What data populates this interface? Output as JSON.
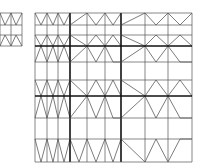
{
  "diagram": {
    "colors": {
      "background": "#ffffff",
      "thin_line": "#555555",
      "thick_line": "#111111"
    },
    "small_grid": {
      "x": [
        0,
        11,
        22
      ],
      "y": [
        13,
        25,
        35,
        46
      ],
      "zigzags": [
        [
          [
            0,
            13
          ],
          [
            5,
            25
          ],
          [
            11,
            13
          ],
          [
            16,
            25
          ],
          [
            22,
            13
          ]
        ],
        [
          [
            0,
            46
          ],
          [
            5,
            35
          ],
          [
            11,
            46
          ],
          [
            16,
            35
          ],
          [
            22,
            46
          ]
        ]
      ]
    },
    "large_grid": {
      "x": [
        35,
        47,
        58,
        70,
        87,
        105,
        121,
        145,
        168,
        192
      ],
      "y": [
        13,
        25,
        35,
        46,
        62,
        80,
        96,
        118,
        139,
        162
      ],
      "thick_x": [
        70,
        121
      ],
      "thick_y": [
        46,
        96
      ],
      "zigzags": [
        [
          [
            35,
            13
          ],
          [
            41,
            25
          ],
          [
            47,
            13
          ],
          [
            53,
            25
          ],
          [
            58,
            13
          ],
          [
            64,
            25
          ],
          [
            70,
            13
          ]
        ],
        [
          [
            70,
            25
          ],
          [
            87,
            13
          ],
          [
            96,
            25
          ],
          [
            105,
            13
          ],
          [
            113,
            25
          ],
          [
            121,
            13
          ]
        ],
        [
          [
            121,
            25
          ],
          [
            145,
            13
          ],
          [
            156,
            25
          ],
          [
            168,
            13
          ],
          [
            180,
            25
          ],
          [
            192,
            13
          ]
        ],
        [
          [
            35,
            35
          ],
          [
            41,
            46
          ],
          [
            47,
            35
          ],
          [
            53,
            46
          ],
          [
            58,
            35
          ],
          [
            64,
            46
          ],
          [
            70,
            35
          ]
        ],
        [
          [
            35,
            62
          ],
          [
            41,
            46
          ],
          [
            47,
            62
          ],
          [
            53,
            46
          ],
          [
            58,
            62
          ],
          [
            64,
            46
          ],
          [
            70,
            62
          ]
        ],
        [
          [
            70,
            35
          ],
          [
            87,
            46
          ],
          [
            96,
            35
          ],
          [
            105,
            46
          ],
          [
            113,
            35
          ],
          [
            121,
            46
          ]
        ],
        [
          [
            70,
            62
          ],
          [
            87,
            46
          ],
          [
            96,
            62
          ],
          [
            105,
            46
          ],
          [
            113,
            62
          ],
          [
            121,
            62
          ]
        ],
        [
          [
            121,
            35
          ],
          [
            145,
            46
          ],
          [
            156,
            35
          ],
          [
            168,
            46
          ],
          [
            180,
            35
          ],
          [
            192,
            46
          ]
        ],
        [
          [
            121,
            62
          ],
          [
            145,
            46
          ],
          [
            156,
            62
          ],
          [
            168,
            46
          ],
          [
            180,
            62
          ],
          [
            192,
            62
          ]
        ],
        [
          [
            35,
            80
          ],
          [
            41,
            96
          ],
          [
            47,
            80
          ],
          [
            53,
            96
          ],
          [
            58,
            80
          ],
          [
            64,
            96
          ],
          [
            70,
            80
          ]
        ],
        [
          [
            35,
            118
          ],
          [
            41,
            96
          ],
          [
            47,
            118
          ],
          [
            53,
            96
          ],
          [
            58,
            118
          ],
          [
            64,
            96
          ],
          [
            70,
            118
          ]
        ],
        [
          [
            70,
            80
          ],
          [
            87,
            96
          ],
          [
            96,
            80
          ],
          [
            105,
            96
          ],
          [
            113,
            80
          ],
          [
            121,
            96
          ]
        ],
        [
          [
            70,
            118
          ],
          [
            87,
            96
          ],
          [
            96,
            118
          ],
          [
            105,
            96
          ],
          [
            113,
            118
          ],
          [
            121,
            118
          ]
        ],
        [
          [
            121,
            80
          ],
          [
            145,
            96
          ],
          [
            156,
            80
          ],
          [
            168,
            96
          ],
          [
            180,
            80
          ],
          [
            192,
            96
          ]
        ],
        [
          [
            121,
            118
          ],
          [
            145,
            96
          ],
          [
            156,
            118
          ],
          [
            168,
            96
          ],
          [
            180,
            118
          ],
          [
            192,
            118
          ]
        ],
        [
          [
            35,
            139
          ],
          [
            41,
            162
          ],
          [
            47,
            139
          ],
          [
            53,
            162
          ],
          [
            58,
            139
          ],
          [
            64,
            162
          ],
          [
            70,
            139
          ]
        ],
        [
          [
            70,
            139
          ],
          [
            79,
            162
          ],
          [
            87,
            139
          ],
          [
            96,
            162
          ],
          [
            105,
            139
          ],
          [
            113,
            162
          ],
          [
            121,
            139
          ]
        ],
        [
          [
            121,
            139
          ],
          [
            145,
            162
          ],
          [
            156,
            139
          ],
          [
            168,
            162
          ],
          [
            180,
            139
          ],
          [
            192,
            139
          ]
        ]
      ]
    }
  }
}
